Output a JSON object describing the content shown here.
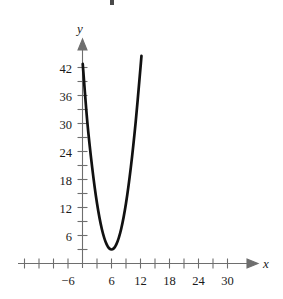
{
  "chart_data": {
    "type": "line",
    "title": "",
    "subtitle": "",
    "xlabel": "x",
    "ylabel": "y",
    "xlim": [
      -9,
      33
    ],
    "ylim": [
      0,
      45
    ],
    "grid": false,
    "legend": null,
    "x_ticks_major": [
      -6,
      6,
      12,
      18,
      24,
      30
    ],
    "x_tick_labels": [
      "−6",
      "6",
      "12",
      "18",
      "24",
      "30"
    ],
    "x_ticks_all": [
      -9,
      -6,
      -3,
      0,
      3,
      6,
      9,
      12,
      15,
      18,
      21,
      24,
      27,
      30
    ],
    "x_tick_step": 3,
    "y_ticks_major": [
      6,
      12,
      18,
      24,
      30,
      36,
      42
    ],
    "y_tick_labels": [
      "6",
      "12",
      "18",
      "24",
      "30",
      "36",
      "42"
    ],
    "y_ticks_all": [
      3,
      6,
      9,
      12,
      15,
      18,
      21,
      24,
      27,
      30,
      33,
      36,
      39,
      42
    ],
    "y_tick_step": 3,
    "curve": {
      "name": "parabola",
      "shape": "upward-opening parabola",
      "vertex": [
        6,
        3
      ],
      "equation_form": "y = a(x - 6)^2 + 3",
      "a": 1.1,
      "domain": [
        0,
        12.5
      ],
      "color": "#111111",
      "points": [
        [
          0.05,
          42.8
        ],
        [
          1,
          30.3
        ],
        [
          2,
          20.6
        ],
        [
          3,
          12.9
        ],
        [
          4,
          7.4
        ],
        [
          5,
          4.1
        ],
        [
          6,
          3.0
        ],
        [
          7,
          4.1
        ],
        [
          8,
          7.4
        ],
        [
          9,
          12.9
        ],
        [
          10,
          20.6
        ],
        [
          11,
          30.3
        ],
        [
          12,
          42.0
        ],
        [
          12.2,
          44.5
        ]
      ]
    }
  },
  "axes": {
    "x_axis_label": "x",
    "y_axis_label": "y"
  }
}
